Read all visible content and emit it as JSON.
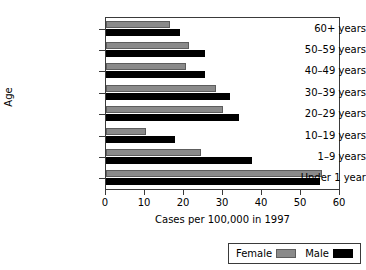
{
  "chart_data": {
    "type": "bar",
    "orientation": "horizontal",
    "title": "",
    "xlabel": "Cases per 100,000 in 1997",
    "ylabel": "Age",
    "xlim": [
      0,
      60
    ],
    "xticks": [
      0,
      10,
      20,
      30,
      40,
      50,
      60
    ],
    "xtick_labels": [
      "0",
      "10",
      "20",
      "30",
      "40",
      "50",
      "60"
    ],
    "grid": false,
    "legend_position": "bottom-right",
    "categories": [
      "Under 1 year",
      "1–9 years",
      "10–19 years",
      "20–29 years",
      "30–39 years",
      "40–49 years",
      "50–59 years",
      "60+ years"
    ],
    "series": [
      {
        "name": "Female",
        "color": "#8a8a8a",
        "values": [
          55.5,
          24.3,
          10.2,
          30.1,
          28.1,
          20.4,
          21.4,
          16.3
        ]
      },
      {
        "name": "Male",
        "color": "#000000",
        "values": [
          54.8,
          37.5,
          17.6,
          34.0,
          31.9,
          25.5,
          25.5,
          19.1
        ]
      }
    ]
  },
  "legend": {
    "entries": [
      {
        "label": "Female",
        "swatch": "female-swatch"
      },
      {
        "label": "Male",
        "swatch": "male-swatch"
      }
    ]
  }
}
